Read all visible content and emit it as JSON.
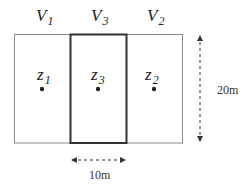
{
  "diagram": {
    "type": "spatial-layout",
    "volumes": [
      {
        "name": "V",
        "subscript": "1",
        "position": "left"
      },
      {
        "name": "V",
        "subscript": "3",
        "position": "center"
      },
      {
        "name": "V",
        "subscript": "2",
        "position": "right"
      }
    ],
    "points": [
      {
        "name": "z",
        "subscript": "1",
        "region": "left"
      },
      {
        "name": "z",
        "subscript": "3",
        "region": "center"
      },
      {
        "name": "z",
        "subscript": "2",
        "region": "right"
      }
    ],
    "dimensions": {
      "height_label": "20m",
      "width_label": "10m"
    },
    "colors": {
      "outline": "#8a8a8a",
      "highlight_outline": "#333333",
      "text": "#222222"
    }
  }
}
